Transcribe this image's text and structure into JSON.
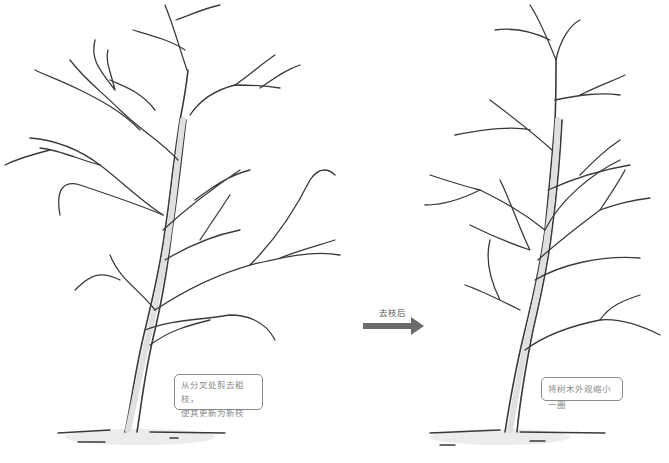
{
  "diagram": {
    "left_panel": {
      "caption_line1": "从分叉处剪去粗枝，",
      "caption_line2": "使其更新为新枝"
    },
    "arrow": {
      "label": "去枝后",
      "color": "#6b6b6b"
    },
    "right_panel": {
      "caption": "将树木外观缩小一圈"
    },
    "colors": {
      "line": "#3a3a3a",
      "trunk_fill": "#e4e4e4",
      "box_border": "#8a8a8a",
      "box_text": "#8a8a8a"
    }
  }
}
